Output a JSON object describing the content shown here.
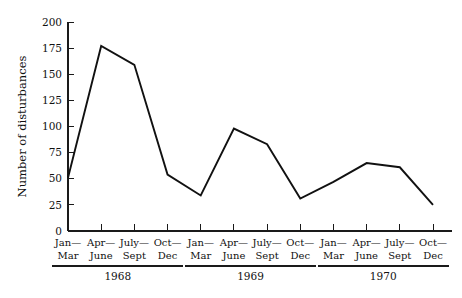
{
  "chart_data": {
    "type": "line",
    "title": "",
    "xlabel": "",
    "ylabel": "Number of disturbances",
    "ylim": [
      0,
      200
    ],
    "yticks": [
      0,
      25,
      50,
      75,
      100,
      125,
      150,
      175,
      200
    ],
    "ytick_labels": [
      "0",
      "25",
      "50",
      "75",
      "100",
      "125",
      "150",
      "175",
      "200"
    ],
    "grid": false,
    "legend": false,
    "categories": [
      "Jan—Mar",
      "Apr—June",
      "July—Sept",
      "Oct—Dec",
      "Jan—Mar",
      "Apr—June",
      "July—Sept",
      "Oct—Dec",
      "Jan—Mar",
      "Apr—June",
      "July—Sept",
      "Oct—Dec"
    ],
    "xtick_labels_line1": [
      "Jan—",
      "Apr—",
      "July—",
      "Oct—",
      "Jan—",
      "Apr—",
      "July—",
      "Oct—",
      "Jan—",
      "Apr—",
      "July—",
      "Oct—"
    ],
    "xtick_labels_line2": [
      "Mar",
      "June",
      "Sept",
      "Dec",
      "Mar",
      "June",
      "Sept",
      "Dec",
      "Mar",
      "June",
      "Sept",
      "Dec"
    ],
    "values": [
      51,
      177,
      159,
      54,
      34,
      98,
      83,
      31,
      47,
      65,
      61,
      25
    ],
    "groups": [
      {
        "label": "1968",
        "start_index": 0,
        "end_index": 3
      },
      {
        "label": "1969",
        "start_index": 4,
        "end_index": 7
      },
      {
        "label": "1970",
        "start_index": 8,
        "end_index": 11
      }
    ],
    "line_color": "#111111",
    "axis_color": "#1a1a1a",
    "background_color": "#ffffff"
  }
}
